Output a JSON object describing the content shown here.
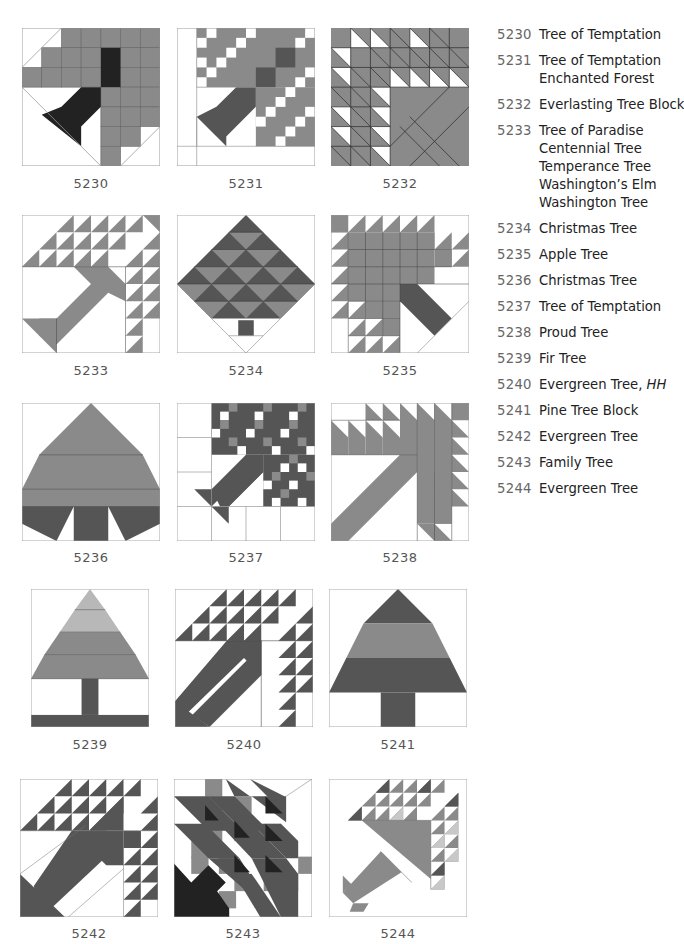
{
  "colors": {
    "medium_gray": "#8a8a8a",
    "dark_gray": "#555555",
    "near_black": "#222222",
    "light_gray": "#b8b8b8",
    "outline": "#9a9a9a"
  },
  "blocks": [
    {
      "id": "5230",
      "label": "5230"
    },
    {
      "id": "5231",
      "label": "5231"
    },
    {
      "id": "5232",
      "label": "5232"
    },
    {
      "id": "5233",
      "label": "5233"
    },
    {
      "id": "5234",
      "label": "5234"
    },
    {
      "id": "5235",
      "label": "5235"
    },
    {
      "id": "5236",
      "label": "5236"
    },
    {
      "id": "5237",
      "label": "5237"
    },
    {
      "id": "5238",
      "label": "5238"
    },
    {
      "id": "5239",
      "label": "5239"
    },
    {
      "id": "5240",
      "label": "5240"
    },
    {
      "id": "5241",
      "label": "5241"
    },
    {
      "id": "5242",
      "label": "5242"
    },
    {
      "id": "5243",
      "label": "5243"
    },
    {
      "id": "5244",
      "label": "5244"
    }
  ],
  "index": [
    {
      "num": "5230",
      "names": [
        "Tree of Temptation"
      ]
    },
    {
      "num": "5231",
      "names": [
        "Tree of Temptation",
        "Enchanted Forest"
      ]
    },
    {
      "num": "5232",
      "names": [
        "Everlasting Tree Block"
      ]
    },
    {
      "num": "5233",
      "names": [
        "Tree of Paradise",
        "Centennial Tree",
        "Temperance Tree",
        "Washington’s Elm",
        "Washington Tree"
      ]
    },
    {
      "num": "5234",
      "names": [
        "Christmas Tree"
      ]
    },
    {
      "num": "5235",
      "names": [
        "Apple Tree"
      ]
    },
    {
      "num": "5236",
      "names": [
        "Christmas Tree"
      ]
    },
    {
      "num": "5237",
      "names": [
        "Tree of Temptation"
      ]
    },
    {
      "num": "5238",
      "names": [
        "Proud Tree"
      ]
    },
    {
      "num": "5239",
      "names": [
        "Fir Tree"
      ]
    },
    {
      "num": "5240",
      "names": [
        "Evergreen Tree,"
      ],
      "suffix_italic": "HH"
    },
    {
      "num": "5241",
      "names": [
        "Pine Tree Block"
      ]
    },
    {
      "num": "5242",
      "names": [
        "Evergreen Tree"
      ]
    },
    {
      "num": "5243",
      "names": [
        "Family Tree"
      ]
    },
    {
      "num": "5244",
      "names": [
        "Evergreen Tree"
      ]
    }
  ]
}
